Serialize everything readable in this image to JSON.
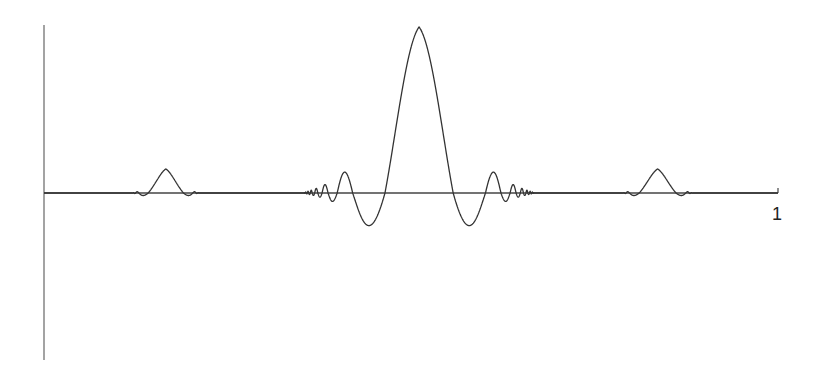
{
  "chart_data": {
    "type": "line",
    "title": "",
    "xlabel": "",
    "ylabel": "",
    "x_tick_labels": [
      "1"
    ],
    "xlim": [
      0,
      1
    ],
    "ylim": [
      -1,
      1
    ],
    "grid": false,
    "legend": null,
    "series": [
      {
        "name": "signal",
        "color": "#333333",
        "packets": [
          {
            "center": 0.166,
            "half_width": 0.046,
            "peak": 0.145,
            "trough": -0.11,
            "side_lobes": 4
          },
          {
            "center": 0.511,
            "half_width": 0.158,
            "peak": 1.0,
            "trough": -0.68,
            "side_lobes": 10
          },
          {
            "center": 0.836,
            "half_width": 0.048,
            "peak": 0.145,
            "trough": -0.11,
            "side_lobes": 4
          }
        ],
        "key_points": [
          {
            "x": 0.511,
            "y": 1.0
          },
          {
            "x": 0.44,
            "y": -0.68
          },
          {
            "x": 0.568,
            "y": -0.68
          },
          {
            "x": 0.425,
            "y": 0.46
          },
          {
            "x": 0.587,
            "y": 0.46
          },
          {
            "x": 0.166,
            "y": 0.145
          },
          {
            "x": 0.836,
            "y": 0.145
          }
        ]
      }
    ]
  },
  "axes": {
    "x_tick": "1",
    "axis_color": "#555555",
    "line_color": "#333333"
  }
}
